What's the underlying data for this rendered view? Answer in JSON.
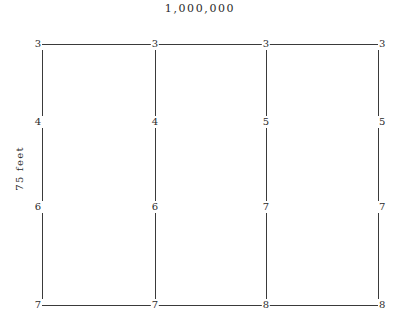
{
  "diagram": {
    "title": "1,000,000",
    "y_axis_label": "75 feet",
    "line_color": "#3a3a3a",
    "background_color": "#ffffff",
    "columns": [
      {
        "name": "column-1",
        "x": 42,
        "label_anchor": "left"
      },
      {
        "name": "column-2",
        "x": 155,
        "label_anchor": "center"
      },
      {
        "name": "column-3",
        "x": 266,
        "label_anchor": "center"
      },
      {
        "name": "column-4",
        "x": 378,
        "label_anchor": "right"
      }
    ],
    "rows": [
      {
        "name": "row-top",
        "y": 44,
        "has_horizontal_rule": true
      },
      {
        "name": "row-second",
        "y": 122,
        "has_horizontal_rule": false
      },
      {
        "name": "row-third",
        "y": 207,
        "has_horizontal_rule": false
      },
      {
        "name": "row-bottom",
        "y": 305,
        "has_horizontal_rule": true
      }
    ],
    "stations": [
      {
        "row": 0,
        "col": 0,
        "value": "3"
      },
      {
        "row": 0,
        "col": 1,
        "value": "3"
      },
      {
        "row": 0,
        "col": 2,
        "value": "3"
      },
      {
        "row": 0,
        "col": 3,
        "value": "3"
      },
      {
        "row": 1,
        "col": 0,
        "value": "4"
      },
      {
        "row": 1,
        "col": 1,
        "value": "4"
      },
      {
        "row": 1,
        "col": 2,
        "value": "5"
      },
      {
        "row": 1,
        "col": 3,
        "value": "5"
      },
      {
        "row": 2,
        "col": 0,
        "value": "6"
      },
      {
        "row": 2,
        "col": 1,
        "value": "6"
      },
      {
        "row": 2,
        "col": 2,
        "value": "7"
      },
      {
        "row": 2,
        "col": 3,
        "value": "7"
      },
      {
        "row": 3,
        "col": 0,
        "value": "7"
      },
      {
        "row": 3,
        "col": 1,
        "value": "7"
      },
      {
        "row": 3,
        "col": 2,
        "value": "8"
      },
      {
        "row": 3,
        "col": 3,
        "value": "8"
      }
    ]
  }
}
